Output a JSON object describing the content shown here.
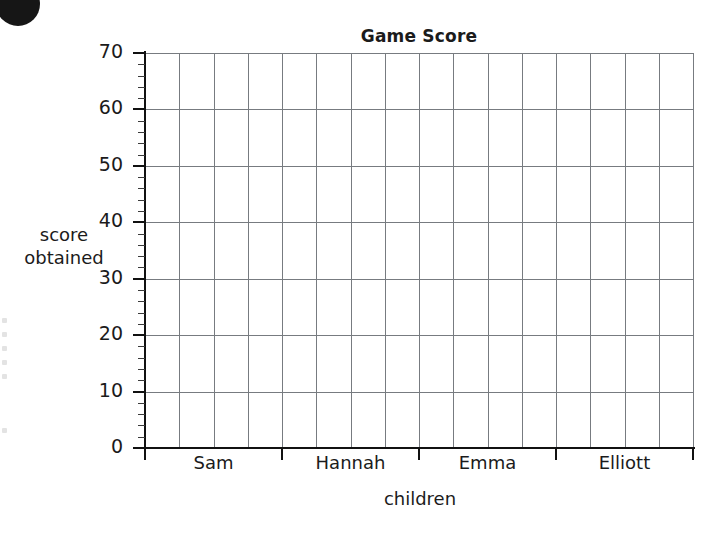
{
  "badge": {
    "name": "worksheet-question-bullet",
    "color": "#161616"
  },
  "chart_data": {
    "type": "bar",
    "title": "Game Score",
    "xlabel": "children",
    "ylabel": "score obtained",
    "categories": [
      "Sam",
      "Hannah",
      "Emma",
      "Elliott"
    ],
    "values": [
      null,
      null,
      null,
      null
    ],
    "ylim": [
      0,
      70
    ],
    "y_major_step": 10,
    "y_minor_step": 2,
    "y_tick_labels": [
      "0",
      "10",
      "20",
      "30",
      "40",
      "50",
      "60",
      "70"
    ],
    "grid": true,
    "grid_columns_total": 16,
    "grid_columns_per_category": 4,
    "legend": null
  },
  "axis": {
    "y_title_line1": "score",
    "y_title_line2": "obtained",
    "x_title": "children"
  },
  "colors": {
    "grid": "#777b80",
    "axis": "#111111",
    "text": "#1b1b1b",
    "background": "#ffffff"
  }
}
